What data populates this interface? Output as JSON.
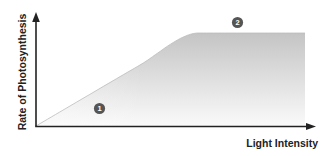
{
  "chart_data": {
    "type": "area",
    "title": "",
    "xlabel": "Light Intensity",
    "ylabel": "Rate of Photosynthesis",
    "x_ticks": [],
    "y_ticks": [],
    "grid": false,
    "legend": null,
    "x": [
      0,
      0.1,
      0.2,
      0.3,
      0.4,
      0.45,
      0.5,
      0.55,
      0.6,
      0.7,
      0.8,
      0.9,
      1.0
    ],
    "series": [
      {
        "name": "Rate of Photosynthesis",
        "values": [
          0,
          0.17,
          0.34,
          0.51,
          0.68,
          0.78,
          0.88,
          0.96,
          1.0,
          1.0,
          1.0,
          1.0,
          1.0
        ]
      }
    ],
    "annotations": [
      {
        "label": "1",
        "region": "linear increase",
        "x": 0.23,
        "y": 0.2
      },
      {
        "label": "2",
        "region": "plateau",
        "x": 0.74,
        "y": 1.12
      }
    ],
    "xlim": [
      0,
      1
    ],
    "ylim": [
      0,
      1.2
    ]
  },
  "colors": {
    "axis": "#222222",
    "fill_top": "#c4c4c4",
    "fill_bottom": "#fafafa",
    "marker": "#555555",
    "marker_text": "#ffffff"
  },
  "labels": {
    "x_axis": "Light Intensity",
    "y_axis": "Rate of Photosynthesis",
    "marker_1": "1",
    "marker_2": "2"
  }
}
